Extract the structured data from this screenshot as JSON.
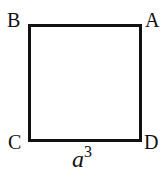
{
  "diagram": {
    "shape": "square",
    "vertices": {
      "top_left": "B",
      "top_right": "A",
      "bottom_left": "C",
      "bottom_right": "D"
    },
    "side_label": {
      "base": "a",
      "exponent": "3"
    },
    "stroke_color": "#111111"
  }
}
